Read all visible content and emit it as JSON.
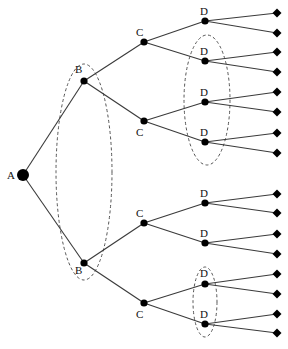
{
  "diagram": {
    "type": "game-tree",
    "root": {
      "id": "A",
      "label": "A",
      "x": 23,
      "y": 175,
      "r": 6
    },
    "nodes": [
      {
        "id": "B1",
        "label": "B",
        "x": 84,
        "y": 81,
        "lx": 75,
        "ly": 64
      },
      {
        "id": "B2",
        "label": "B",
        "x": 84,
        "y": 263,
        "lx": 75,
        "ly": 265
      },
      {
        "id": "C1",
        "label": "C",
        "x": 144,
        "y": 42,
        "lx": 136,
        "ly": 27
      },
      {
        "id": "C2",
        "label": "C",
        "x": 144,
        "y": 121,
        "lx": 136,
        "ly": 127
      },
      {
        "id": "C3",
        "label": "C",
        "x": 144,
        "y": 223,
        "lx": 136,
        "ly": 208
      },
      {
        "id": "C4",
        "label": "C",
        "x": 144,
        "y": 303,
        "lx": 136,
        "ly": 309
      },
      {
        "id": "D1",
        "label": "D",
        "x": 205,
        "y": 21,
        "lx": 200,
        "ly": 6
      },
      {
        "id": "D2",
        "label": "D",
        "x": 205,
        "y": 61,
        "lx": 200,
        "ly": 46
      },
      {
        "id": "D3",
        "label": "D",
        "x": 205,
        "y": 102,
        "lx": 200,
        "ly": 87
      },
      {
        "id": "D4",
        "label": "D",
        "x": 205,
        "y": 142,
        "lx": 200,
        "ly": 127
      },
      {
        "id": "D5",
        "label": "D",
        "x": 205,
        "y": 203,
        "lx": 200,
        "ly": 188
      },
      {
        "id": "D6",
        "label": "D",
        "x": 205,
        "y": 243,
        "lx": 200,
        "ly": 228
      },
      {
        "id": "D7",
        "label": "D",
        "x": 205,
        "y": 284,
        "lx": 200,
        "ly": 268
      },
      {
        "id": "D8",
        "label": "D",
        "x": 205,
        "y": 324,
        "lx": 200,
        "ly": 309
      }
    ],
    "edges": [
      [
        "A",
        "B1"
      ],
      [
        "A",
        "B2"
      ],
      [
        "B1",
        "C1"
      ],
      [
        "B1",
        "C2"
      ],
      [
        "B2",
        "C3"
      ],
      [
        "B2",
        "C4"
      ],
      [
        "C1",
        "D1"
      ],
      [
        "C1",
        "D2"
      ],
      [
        "C2",
        "D3"
      ],
      [
        "C2",
        "D4"
      ],
      [
        "C3",
        "D5"
      ],
      [
        "C3",
        "D6"
      ],
      [
        "C4",
        "D7"
      ],
      [
        "C4",
        "D8"
      ]
    ],
    "leaves": [
      {
        "parent": "D1",
        "x": 277,
        "y": 13
      },
      {
        "parent": "D1",
        "x": 277,
        "y": 33
      },
      {
        "parent": "D2",
        "x": 277,
        "y": 52
      },
      {
        "parent": "D2",
        "x": 277,
        "y": 72
      },
      {
        "parent": "D3",
        "x": 277,
        "y": 92
      },
      {
        "parent": "D3",
        "x": 277,
        "y": 112
      },
      {
        "parent": "D4",
        "x": 277,
        "y": 133
      },
      {
        "parent": "D4",
        "x": 277,
        "y": 153
      },
      {
        "parent": "D5",
        "x": 277,
        "y": 194
      },
      {
        "parent": "D5",
        "x": 277,
        "y": 213
      },
      {
        "parent": "D6",
        "x": 277,
        "y": 234
      },
      {
        "parent": "D6",
        "x": 277,
        "y": 254
      },
      {
        "parent": "D7",
        "x": 277,
        "y": 274
      },
      {
        "parent": "D7",
        "x": 277,
        "y": 294
      },
      {
        "parent": "D8",
        "x": 277,
        "y": 314
      },
      {
        "parent": "D8",
        "x": 277,
        "y": 333
      }
    ],
    "information_sets": [
      {
        "name": "B-set",
        "members": [
          "B1",
          "B2"
        ],
        "cx": 84,
        "cy": 172,
        "rx": 28,
        "ry": 108
      },
      {
        "name": "D-set-upper",
        "members": [
          "D2",
          "D3",
          "D4"
        ],
        "cx": 207,
        "cy": 100,
        "rx": 23,
        "ry": 65
      },
      {
        "name": "D-set-lower",
        "members": [
          "D7",
          "D8"
        ],
        "cx": 205,
        "cy": 302,
        "rx": 12,
        "ry": 35
      }
    ]
  }
}
